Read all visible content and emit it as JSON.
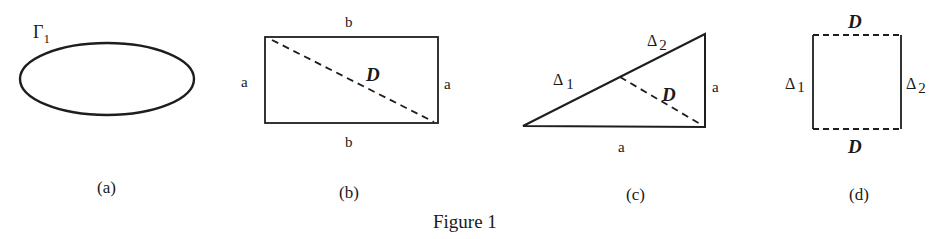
{
  "figure": {
    "caption": "Figure 1",
    "panels": [
      {
        "id": "a",
        "caption": "(a)",
        "shape": "ellipse",
        "labels": {
          "curve": "Γ",
          "curve_sub": "1"
        }
      },
      {
        "id": "b",
        "caption": "(b)",
        "shape": "rectangle with dashed diagonal",
        "labels": {
          "top": "b",
          "bottom": "b",
          "left": "a",
          "right": "a",
          "diagonal": "D"
        }
      },
      {
        "id": "c",
        "caption": "(c)",
        "shape": "right triangle with dashed segment",
        "labels": {
          "hyp_upper": "Δ",
          "hyp_upper_sub": "2",
          "hyp_lower": "Δ",
          "hyp_lower_sub": "1",
          "dashed": "D",
          "right": "a",
          "bottom": "a"
        }
      },
      {
        "id": "d",
        "caption": "(d)",
        "shape": "square with dashed top and bottom",
        "labels": {
          "top": "D",
          "bottom": "D",
          "left": "Δ",
          "left_sub": "1",
          "right": "Δ",
          "right_sub": "2"
        }
      }
    ]
  },
  "colors": {
    "ink": "#1e1e1e",
    "background": "#ffffff"
  }
}
